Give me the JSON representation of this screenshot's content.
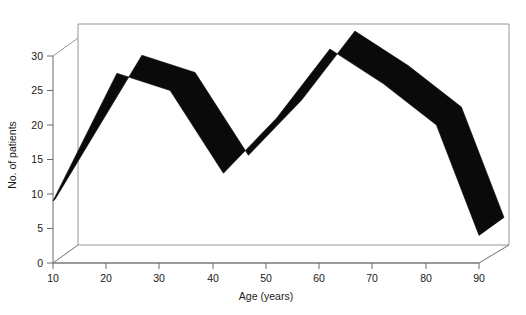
{
  "chart_data": {
    "type": "area",
    "title": "",
    "subtitle": "",
    "xlabel": "Age (years)",
    "ylabel": "No. of patients",
    "x": [
      10,
      22,
      32,
      42,
      52,
      62,
      72,
      82,
      90
    ],
    "values": [
      9,
      27.5,
      25,
      13,
      21,
      31,
      26,
      20,
      4
    ],
    "series": [
      {
        "name": "No. of patients",
        "values": [
          9,
          27.5,
          25,
          13,
          21,
          31,
          26,
          20,
          4
        ]
      }
    ],
    "xlim": [
      10,
      90
    ],
    "ylim": [
      0,
      32
    ],
    "xticks": [
      10,
      20,
      30,
      40,
      50,
      60,
      70,
      80,
      90
    ],
    "yticks": [
      0,
      5,
      10,
      15,
      20,
      25,
      30
    ],
    "xtick_labels": [
      "10",
      "20",
      "30",
      "40",
      "50",
      "60",
      "70",
      "80",
      "90"
    ],
    "ytick_labels": [
      "0",
      "5",
      "10",
      "15",
      "20",
      "25",
      "30"
    ],
    "grid": false,
    "legend": false,
    "legend_position": "none",
    "projection": "3d-ribbon",
    "series_color": "#0a0a0a",
    "axis_color": "#6b6b6b",
    "background_color": "#ffffff",
    "annotations": []
  },
  "axes": {
    "y_title": "No. of patients",
    "x_title": "Age (years)"
  }
}
